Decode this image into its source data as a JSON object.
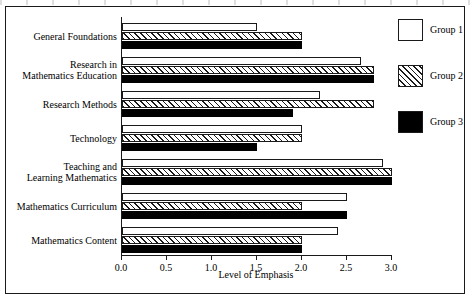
{
  "chart_data": {
    "type": "bar",
    "orientation": "horizontal",
    "title": "",
    "xlabel": "Level of Emphasis",
    "ylabel": "",
    "xlim": [
      0.0,
      3.0
    ],
    "xticks": [
      "0.0",
      "0.5",
      "1.0",
      "1.5",
      "2.0",
      "2.5",
      "3.0"
    ],
    "xtick_values": [
      0.0,
      0.5,
      1.0,
      1.5,
      2.0,
      2.5,
      3.0
    ],
    "grid": false,
    "legend_position": "right",
    "categories": [
      "General Foundations",
      "Research in\nMathematics Education",
      "Research Methods",
      "Technology",
      "Teaching and\nLearning Mathematics",
      "Mathematics Curriculum",
      "Mathematics Content"
    ],
    "category_lines": [
      [
        "General Foundations"
      ],
      [
        "Research in",
        "Mathematics Education"
      ],
      [
        "Research Methods"
      ],
      [
        "Technology"
      ],
      [
        "Teaching and",
        "Learning Mathematics"
      ],
      [
        "Mathematics Curriculum"
      ],
      [
        "Mathematics Content"
      ]
    ],
    "series": [
      {
        "name": "Group 1",
        "fill": "white",
        "color": "#ffffff",
        "values": [
          1.5,
          2.65,
          2.2,
          2.0,
          2.9,
          2.5,
          2.4
        ]
      },
      {
        "name": "Group 2",
        "fill": "hatched",
        "color": "#ffffff",
        "values": [
          2.0,
          2.8,
          2.8,
          2.0,
          3.0,
          2.0,
          2.0
        ]
      },
      {
        "name": "Group 3",
        "fill": "black",
        "color": "#000000",
        "values": [
          2.0,
          2.8,
          1.9,
          1.5,
          3.0,
          2.5,
          2.0
        ]
      }
    ]
  },
  "legend": {
    "items": [
      {
        "label": "Group 1"
      },
      {
        "label": "Group 2"
      },
      {
        "label": "Group 3"
      }
    ]
  }
}
